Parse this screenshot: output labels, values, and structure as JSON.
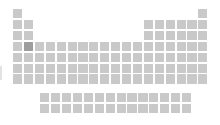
{
  "diagram": {
    "type": "periodic-table-minimap",
    "canvas": {
      "width": 220,
      "height": 125,
      "background": "#ffffff"
    },
    "colors": {
      "cell_default": "#c9c9c9",
      "cell_highlight": "#9d9d9d",
      "background": "#ffffff",
      "edge_artifact": "#d8d8d8"
    },
    "geometry": {
      "origin_x": 13,
      "origin_y": 9,
      "col_pitch": 10.9,
      "row_pitch": 10.9,
      "cell_width": 9.2,
      "cell_height": 9.2,
      "fblock_origin_y": 93,
      "fblock_origin_col": 2.5
    },
    "labels": {
      "groups": 18,
      "periods": 7,
      "fblock_rows": 2,
      "fblock_columns": 14
    },
    "highlighted_cell": {
      "period": 4,
      "group": 2,
      "row_index": 3,
      "col_index": 1,
      "label": "highlighted-element"
    },
    "main_grid_rows": [
      {
        "period": 1,
        "columns": [
          1,
          18
        ]
      },
      {
        "period": 2,
        "columns": [
          1,
          2,
          13,
          14,
          15,
          16,
          17,
          18
        ]
      },
      {
        "period": 3,
        "columns": [
          1,
          2,
          13,
          14,
          15,
          16,
          17,
          18
        ]
      },
      {
        "period": 4,
        "columns": [
          1,
          2,
          3,
          4,
          5,
          6,
          7,
          8,
          9,
          10,
          11,
          12,
          13,
          14,
          15,
          16,
          17,
          18
        ]
      },
      {
        "period": 5,
        "columns": [
          1,
          2,
          3,
          4,
          5,
          6,
          7,
          8,
          9,
          10,
          11,
          12,
          13,
          14,
          15,
          16,
          17,
          18
        ]
      },
      {
        "period": 6,
        "columns": [
          1,
          2,
          3,
          4,
          5,
          6,
          7,
          8,
          9,
          10,
          11,
          12,
          13,
          14,
          15,
          16,
          17,
          18
        ]
      },
      {
        "period": 7,
        "columns": [
          1,
          2,
          3,
          4,
          5,
          6,
          7,
          8,
          9,
          10,
          11,
          12,
          13,
          14,
          15,
          16,
          17,
          18
        ]
      }
    ],
    "fblock_rows": [
      {
        "series": "lanthanides",
        "count": 14
      },
      {
        "series": "actinides",
        "count": 14
      }
    ],
    "edge_artifact": {
      "x": 0,
      "y": 66,
      "width": 2,
      "height": 14
    }
  }
}
